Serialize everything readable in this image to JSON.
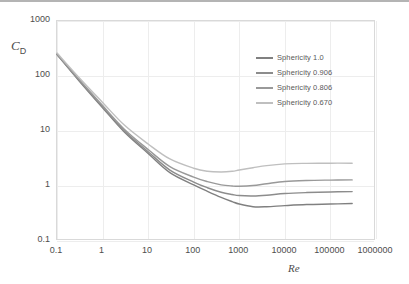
{
  "chart_data": {
    "type": "line",
    "title": "",
    "xlabel": "Re",
    "ylabel": "C_D",
    "xscale": "log",
    "yscale": "log",
    "xlim": [
      0.1,
      1000000
    ],
    "ylim": [
      0.1,
      1000
    ],
    "grid": true,
    "legend_position": "upper right",
    "x_ticks": [
      "0.1",
      "1",
      "10",
      "100",
      "1000",
      "10000",
      "100000",
      "1000000"
    ],
    "y_ticks": [
      "0.1",
      "1",
      "10",
      "100",
      "1000"
    ],
    "series": [
      {
        "name": "Sphericity 1.0",
        "color": "#808080",
        "x": [
          0.1,
          0.3,
          1,
          3,
          10,
          30,
          100,
          200,
          400,
          700,
          1000,
          2000,
          4000,
          10000,
          30000,
          100000,
          300000
        ],
        "y": [
          245,
          83,
          26.5,
          9.6,
          3.9,
          1.75,
          1.05,
          0.8,
          0.62,
          0.52,
          0.47,
          0.42,
          0.42,
          0.44,
          0.46,
          0.47,
          0.48
        ]
      },
      {
        "name": "Sphericity 0.906",
        "color": "#8c8c8c",
        "x": [
          0.1,
          0.3,
          1,
          3,
          10,
          30,
          100,
          200,
          400,
          700,
          1000,
          2000,
          4000,
          10000,
          30000,
          100000,
          300000
        ],
        "y": [
          248,
          85,
          27.5,
          10.1,
          4.2,
          1.95,
          1.18,
          0.93,
          0.77,
          0.7,
          0.67,
          0.66,
          0.68,
          0.73,
          0.76,
          0.78,
          0.79
        ]
      },
      {
        "name": "Sphericity 0.806",
        "color": "#999999",
        "x": [
          0.1,
          0.3,
          1,
          3,
          10,
          30,
          100,
          200,
          400,
          700,
          1000,
          2000,
          4000,
          10000,
          30000,
          100000,
          300000
        ],
        "y": [
          252,
          88,
          29,
          10.8,
          4.6,
          2.25,
          1.45,
          1.2,
          1.05,
          1.0,
          0.99,
          1.02,
          1.1,
          1.21,
          1.26,
          1.28,
          1.29
        ]
      },
      {
        "name": "Sphericity 0.670",
        "color": "#bfbfbf",
        "x": [
          0.1,
          0.3,
          1,
          3,
          10,
          30,
          100,
          200,
          400,
          700,
          1000,
          2000,
          4000,
          10000,
          30000,
          100000,
          300000
        ],
        "y": [
          262,
          95,
          33,
          12.8,
          5.8,
          3.1,
          2.1,
          1.85,
          1.8,
          1.85,
          1.95,
          2.15,
          2.35,
          2.52,
          2.58,
          2.6,
          2.6
        ]
      }
    ]
  },
  "axes": {
    "y_title": "C",
    "y_title_sub": "D",
    "x_title": "Re"
  },
  "legend": {
    "items": [
      {
        "label": "Sphericity 1.0",
        "color": "#808080"
      },
      {
        "label": "Sphericity 0.906",
        "color": "#8c8c8c"
      },
      {
        "label": "Sphericity 0.806",
        "color": "#999999"
      },
      {
        "label": "Sphericity 0.670",
        "color": "#bfbfbf"
      }
    ]
  }
}
